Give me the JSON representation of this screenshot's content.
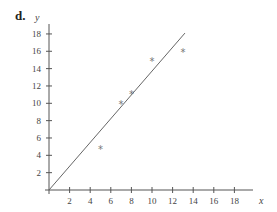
{
  "panel_label": "d.",
  "chart_data": {
    "type": "scatter",
    "title": "",
    "xlabel": "x",
    "ylabel": "y",
    "xlim": [
      0,
      19
    ],
    "ylim": [
      0,
      19
    ],
    "x_ticks": [
      2,
      4,
      6,
      8,
      10,
      12,
      14,
      16,
      18
    ],
    "y_ticks": [
      2,
      4,
      6,
      8,
      10,
      12,
      14,
      16,
      18
    ],
    "grid": false,
    "legend": null,
    "series": [
      {
        "name": "data points",
        "marker": "*",
        "points": [
          [
            5,
            4.8
          ],
          [
            7,
            10
          ],
          [
            8,
            11.2
          ],
          [
            10,
            15
          ],
          [
            13,
            16
          ]
        ]
      }
    ],
    "lines": [
      {
        "name": "fitted line",
        "from": [
          0,
          0
        ],
        "to": [
          13.2,
          18.1
        ],
        "slope": 1.37
      }
    ],
    "colors": {
      "axis": "#555555",
      "line": "#666666",
      "marker": "#777777"
    }
  }
}
